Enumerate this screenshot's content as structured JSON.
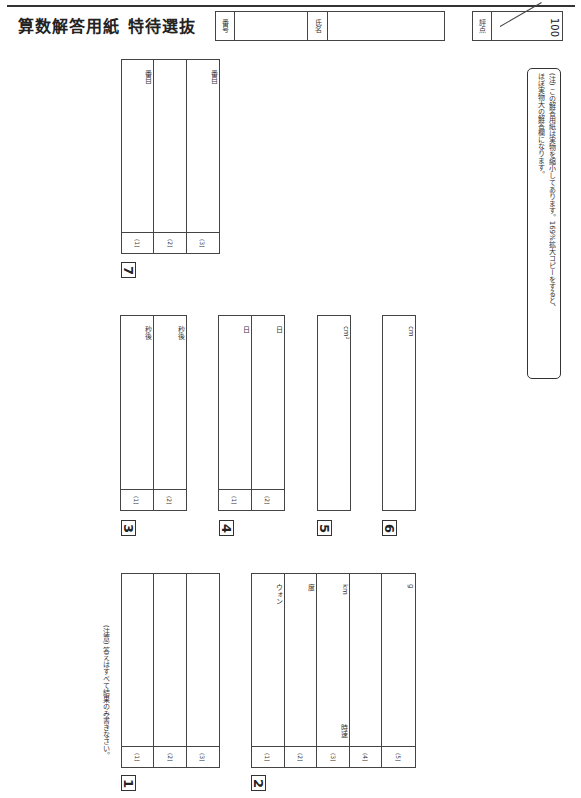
{
  "header": {
    "title": "算数解答用紙",
    "subtitle": "特待選抜",
    "number_label": "番号",
    "name_label": "氏名",
    "score_label": "評点",
    "score_max": "100"
  },
  "notice": "(注意) 答えはすべて結果のみ書きなさい。",
  "note_box": {
    "line1": "(注) この解答用紙は実物を縮小してあります。169%拡大コピーをすると、",
    "line2": "ほぼ実物大の解答欄になります。"
  },
  "sections": {
    "s1": {
      "marker": "1",
      "items": [
        {
          "num": "(1)"
        },
        {
          "num": "(2)"
        },
        {
          "num": "(3)"
        }
      ]
    },
    "s2": {
      "marker": "2",
      "items": [
        {
          "num": "(1)",
          "unit": "ウォン"
        },
        {
          "num": "(2)",
          "unit": "度"
        },
        {
          "num": "(3)",
          "unit": "km",
          "prefix": "時速"
        },
        {
          "num": "(4)"
        },
        {
          "num": "(5)",
          "unit": "g"
        }
      ]
    },
    "s3": {
      "marker": "3",
      "items": [
        {
          "num": "(1)",
          "unit": "秒後"
        },
        {
          "num": "(2)",
          "unit": "秒後"
        }
      ]
    },
    "s4": {
      "marker": "4",
      "items": [
        {
          "num": "(1)",
          "unit": "日"
        },
        {
          "num": "(2)",
          "unit": "日"
        }
      ]
    },
    "s5": {
      "marker": "5",
      "unit": "cm²"
    },
    "s6": {
      "marker": "6",
      "unit": "cm"
    },
    "s7": {
      "marker": "7",
      "items": [
        {
          "num": "(1)",
          "unit": "番目"
        },
        {
          "num": "(2)"
        },
        {
          "num": "(3)",
          "unit": "番目"
        }
      ]
    }
  }
}
